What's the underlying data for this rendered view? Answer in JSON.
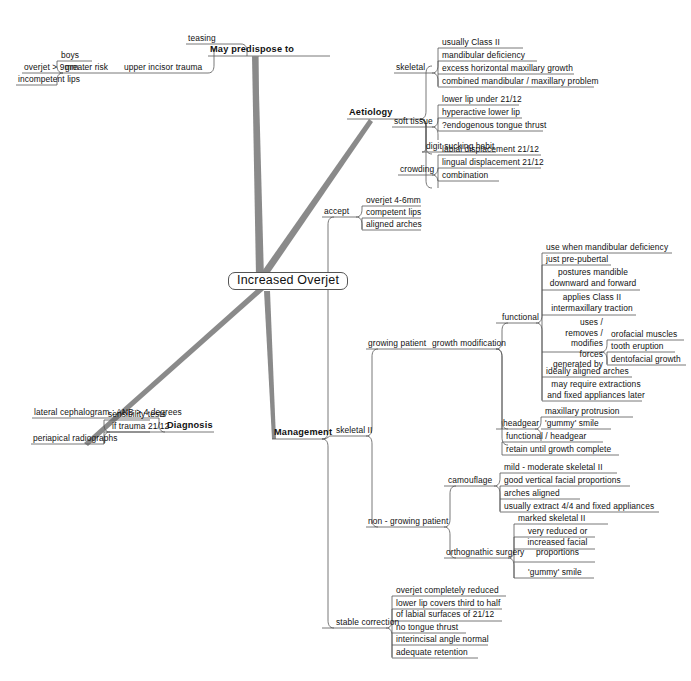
{
  "central": {
    "label": "Increased Overjet"
  },
  "branches": {
    "may_predispose_to": {
      "label": "May predispose to",
      "children": [
        {
          "label": "upper incisor trauma",
          "children": [
            {
              "label": "teasing"
            },
            {
              "label": "greater risk",
              "children": [
                {
                  "label": "boys"
                },
                {
                  "label": "overjet > 9mm"
                },
                {
                  "label": "incompetent lips"
                }
              ]
            }
          ]
        }
      ]
    },
    "aetiology": {
      "label": "Aetiology",
      "children": [
        {
          "label": "skeletal",
          "children": [
            {
              "label": "usually Class II"
            },
            {
              "label": "mandibular deficiency"
            },
            {
              "label": "excess horizontal maxillary growth"
            },
            {
              "label": "combined mandibular / maxillary problem"
            }
          ]
        },
        {
          "label": "soft tissue",
          "children": [
            {
              "label": "lower lip under 21/12"
            },
            {
              "label": "hyperactive lower lip"
            },
            {
              "label": "?endogenous tongue thrust"
            }
          ]
        },
        {
          "label": "digit sucking habit",
          "children": []
        },
        {
          "label": "crowding",
          "children": [
            {
              "label": "labial displacement 21/12"
            },
            {
              "label": "lingual displacement 21/12"
            },
            {
              "label": "combination"
            }
          ]
        }
      ]
    },
    "diagnosis": {
      "label": "Diagnosis",
      "children": [
        {
          "label": "lateral cephalogram : ANB > 4 degrees"
        },
        {
          "label": "if trauma 21/12",
          "children": [
            {
              "label": "sensibility tests"
            },
            {
              "label": "periapical radiographs"
            }
          ]
        }
      ]
    },
    "management": {
      "label": "Management",
      "children": [
        {
          "label": "accept",
          "children": [
            {
              "label": "overjet 4-6mm"
            },
            {
              "label": "competent lips"
            },
            {
              "label": "aligned arches"
            }
          ]
        },
        {
          "label": "skeletal II",
          "children": [
            {
              "label": "growing patient",
              "children": [
                {
                  "label": "growth modification",
                  "children": [
                    {
                      "label": "functional",
                      "children": [
                        {
                          "label": "use when mandibular deficiency"
                        },
                        {
                          "label": "just pre-pubertal"
                        },
                        {
                          "label": "postures mandible downward and forward"
                        },
                        {
                          "label": "applies Class II intermaxillary traction"
                        },
                        {
                          "label": "uses / removes / modifies forces generated by",
                          "children": [
                            {
                              "label": "orofacial muscles"
                            },
                            {
                              "label": "tooth eruption"
                            },
                            {
                              "label": "dentofacial growth"
                            }
                          ]
                        },
                        {
                          "label": "ideally aligned arches"
                        },
                        {
                          "label": "may require extractions and fixed appliances later"
                        }
                      ]
                    },
                    {
                      "label": "headgear",
                      "children": [
                        {
                          "label": "maxillary protrusion"
                        },
                        {
                          "label": "'gummy' smile"
                        }
                      ]
                    },
                    {
                      "label": "functional / headgear"
                    },
                    {
                      "label": "retain until growth complete"
                    }
                  ]
                }
              ]
            },
            {
              "label": "non - growing patient",
              "children": [
                {
                  "label": "camouflage",
                  "children": [
                    {
                      "label": "mild - moderate skeletal II"
                    },
                    {
                      "label": "good vertical facial proportions"
                    },
                    {
                      "label": "arches aligned"
                    },
                    {
                      "label": "usually extract 4/4 and fixed appliances"
                    }
                  ]
                },
                {
                  "label": "orthognathic surgery",
                  "children": [
                    {
                      "label": "marked skeletal II"
                    },
                    {
                      "label": "very reduced or increased facial proportions"
                    },
                    {
                      "label": "'gummy' smile"
                    }
                  ]
                }
              ]
            }
          ]
        },
        {
          "label": "stable correction",
          "children": [
            {
              "label": "overjet completely reduced"
            },
            {
              "label": "lower lip covers third to half of labial surfaces of 21/12"
            },
            {
              "label": "no tongue thrust"
            },
            {
              "label": "interincisal angle normal"
            },
            {
              "label": "adequate retention"
            }
          ]
        }
      ]
    }
  },
  "colors": {
    "line": "#555555",
    "thick_line": "#8a8a8a",
    "text": "#111111",
    "background": "#ffffff"
  }
}
